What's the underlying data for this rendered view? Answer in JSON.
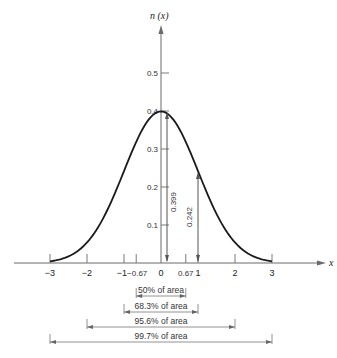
{
  "chart_data": {
    "type": "line",
    "title": "",
    "xlabel": "x",
    "ylabel": "n(x)",
    "xlim": [
      -3.3,
      4.2
    ],
    "ylim": [
      0,
      0.62
    ],
    "x_ticks": [
      -3,
      -2,
      -1,
      -0.67,
      0,
      0.67,
      1,
      2,
      3
    ],
    "x_tick_labels": [
      "−3",
      "−2",
      "−1",
      "−0.67",
      "0",
      "0.67",
      "1",
      "2",
      "3"
    ],
    "y_ticks": [
      0.1,
      0.2,
      0.3,
      0.4,
      0.5
    ],
    "y_tick_labels": [
      "0.1",
      "0.2",
      "0.3",
      "0.4",
      "0.5"
    ],
    "series": [
      {
        "name": "n(x)",
        "x": [
          -3,
          -2.5,
          -2,
          -1.5,
          -1,
          -0.67,
          -0.5,
          0,
          0.5,
          0.67,
          1,
          1.5,
          2,
          2.5,
          3
        ],
        "values": [
          0.0044,
          0.0175,
          0.054,
          0.1295,
          0.242,
          0.3187,
          0.3521,
          0.399,
          0.3521,
          0.3187,
          0.242,
          0.1295,
          0.054,
          0.0175,
          0.0044
        ]
      }
    ],
    "annotations": [
      {
        "type": "vertical-measure",
        "x": 0,
        "value_label": "0.399",
        "value": 0.399
      },
      {
        "type": "vertical-measure",
        "x": 1,
        "value_label": "0.242",
        "value": 0.242
      }
    ],
    "area_brackets": [
      {
        "label": "50% of area",
        "from": -0.67,
        "to": 0.67
      },
      {
        "label": "68.3% of area",
        "from": -1,
        "to": 1
      },
      {
        "label": "95.6% of area",
        "from": -2,
        "to": 2
      },
      {
        "label": "99.7% of area",
        "from": -3,
        "to": 3
      }
    ],
    "grid": false,
    "legend": "none"
  },
  "labels": {
    "y_axis": "n (x)",
    "x_axis": "x",
    "peak_value": "0.399",
    "one_sigma_value": "0.242",
    "bracket_50": "50% of area",
    "bracket_683": "68.3% of area",
    "bracket_956": "95.6% of area",
    "bracket_997": "99.7% of area"
  }
}
